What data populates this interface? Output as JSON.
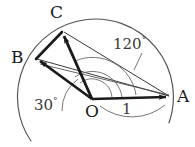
{
  "figure": {
    "background_color": "#ffffff",
    "stroke_color": "#1a1a1a",
    "thin_stroke_color": "#4a4a4a",
    "arc_color": "#55504e",
    "width": 195,
    "height": 147
  },
  "points": {
    "A": {
      "label": "A",
      "x": 172,
      "y": 97
    },
    "B": {
      "label": "B",
      "x": 33,
      "y": 57
    },
    "C": {
      "label": "C",
      "x": 61,
      "y": 30
    },
    "O": {
      "label": "O",
      "x": 92,
      "y": 100
    }
  },
  "labels": {
    "angle_120": {
      "text": "120",
      "degree_symbol": "°"
    },
    "angle_30": {
      "text": "30",
      "degree_symbol": "°"
    },
    "length_1": {
      "text": "1"
    }
  },
  "elements": {
    "vector_oa": "vector-OA",
    "vector_ob": "vector-OB",
    "vector_oc": "vector-OC",
    "segment_bc": "segment-BC",
    "chord_ab": "chord-AB",
    "chord_ac": "chord-AC",
    "circle_arc": "unit-circle-arc",
    "arc_120": "angle-arc-120",
    "arc_30": "angle-arc-30",
    "brace_1": "length-brace-1"
  }
}
